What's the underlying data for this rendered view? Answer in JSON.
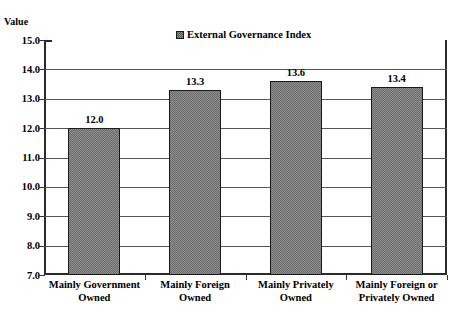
{
  "chart_data": {
    "type": "bar",
    "title": "",
    "xlabel": "",
    "ylabel": "Value",
    "ylim": [
      7.0,
      15.0
    ],
    "ytick_step": 1.0,
    "grid": true,
    "legend_position": "top-center",
    "categories": [
      "Mainly Government Owned",
      "Mainly Foreign Owned",
      "Mainly Privately Owned",
      "Mainly Foreign or Privately Owned"
    ],
    "category_lines": [
      [
        "Mainly Government",
        "Owned"
      ],
      [
        "Mainly Foreign",
        "Owned"
      ],
      [
        "Mainly Privately",
        "Owned"
      ],
      [
        "Mainly Foreign or",
        "Privately Owned"
      ]
    ],
    "series": [
      {
        "name": "External Governance Index",
        "values": [
          12.0,
          13.3,
          13.6,
          13.4
        ],
        "value_labels": [
          "12.0",
          "13.3",
          "13.6",
          "13.4"
        ],
        "fill": "#8c8c8c",
        "pattern": "checker-dither",
        "border": "#1a1a1a"
      }
    ],
    "ytick_labels": [
      "15.0",
      "14.0",
      "13.0",
      "12.0",
      "11.0",
      "10.0",
      "9.0",
      "8.0",
      "7.0"
    ],
    "ytick_values": [
      15.0,
      14.0,
      13.0,
      12.0,
      11.0,
      10.0,
      9.0,
      8.0,
      7.0
    ]
  },
  "axis": {
    "value_title": "Value"
  },
  "legend": {
    "swatch_icon": "hatched-square-icon",
    "label": "External Governance Index"
  },
  "colors": {
    "bar_fill": "#8c8c8c",
    "bar_pattern": "#6e6e6e",
    "bar_border": "#1a1a1a",
    "gridline": "#555555",
    "axis": "#2b2b2b",
    "text": "#000000",
    "background": "#ffffff"
  }
}
